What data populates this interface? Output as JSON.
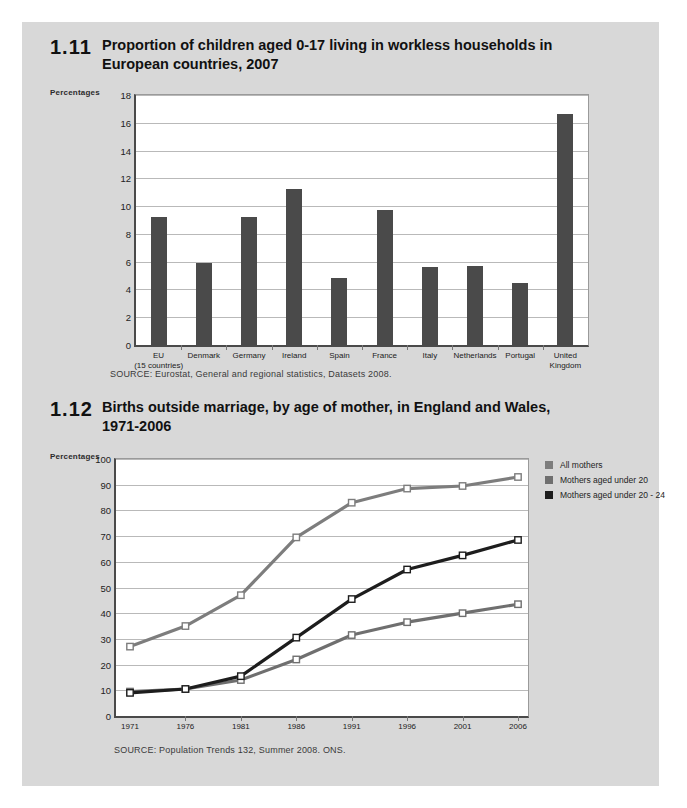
{
  "page": {
    "background_color": "#d8d8d8",
    "plot_background_color": "#ffffff"
  },
  "figures": [
    {
      "number": "1.11",
      "title": "Proportion of children aged 0-17 living in workless households in European countries, 2007",
      "axis_caption": "Percentages",
      "source": "SOURCE: Eurostat, General and regional statistics, Datasets 2008."
    },
    {
      "number": "1.12",
      "title": "Births outside marriage, by age of mother, in England and Wales, 1971-2006",
      "axis_caption": "Percentages",
      "source": "SOURCE: Population Trends 132, Summer  2008. ONS."
    }
  ],
  "chart_data": [
    {
      "type": "bar",
      "title": "Proportion of children aged 0-17 living in workless households in European countries, 2007",
      "xlabel": "",
      "ylabel": "Percentages",
      "ylim": [
        0,
        18
      ],
      "yticks": [
        0,
        2,
        4,
        6,
        8,
        10,
        12,
        14,
        16,
        18
      ],
      "grid": true,
      "legend": "none",
      "bar_color": "#4a4a4a",
      "categories": [
        "EU\n(15 countries)",
        "Denmark",
        "Germany",
        "Ireland",
        "Spain",
        "France",
        "Italy",
        "Netherlands",
        "Portugal",
        "United\nKingdom"
      ],
      "category_lines": [
        [
          "EU",
          "(15 countries)"
        ],
        [
          "Denmark"
        ],
        [
          "Germany"
        ],
        [
          "Ireland"
        ],
        [
          "Spain"
        ],
        [
          "France"
        ],
        [
          "Italy"
        ],
        [
          "Netherlands"
        ],
        [
          "Portugal"
        ],
        [
          "United",
          "Kingdom"
        ]
      ],
      "values": [
        9.2,
        5.9,
        9.2,
        11.2,
        4.8,
        9.7,
        5.6,
        5.7,
        4.5,
        16.6
      ]
    },
    {
      "type": "line",
      "title": "Births outside marriage, by age of mother, in England and Wales, 1971-2006",
      "xlabel": "",
      "ylabel": "Percentages",
      "ylim": [
        0,
        100
      ],
      "yticks": [
        0,
        10,
        20,
        30,
        40,
        50,
        60,
        70,
        80,
        90,
        100
      ],
      "x": [
        "1971",
        "1976",
        "1981",
        "1986",
        "1991",
        "1996",
        "2001",
        "2006"
      ],
      "grid": true,
      "legend": "right",
      "series": [
        {
          "name": "All mothers",
          "color": "#7d7d7d",
          "values": [
            27,
            35,
            47,
            69.5,
            83,
            88.5,
            89.5,
            93
          ]
        },
        {
          "name": "Mothers aged under 20",
          "color": "#6f6f6f",
          "values": [
            9.5,
            10.5,
            14,
            22,
            31.5,
            36.5,
            40,
            43.5
          ]
        },
        {
          "name": "Mothers aged under 20 - 24",
          "color": "#1d1d1d",
          "values": [
            9,
            10.5,
            15.5,
            30.5,
            45.5,
            57,
            62.5,
            68.5
          ]
        }
      ]
    }
  ]
}
